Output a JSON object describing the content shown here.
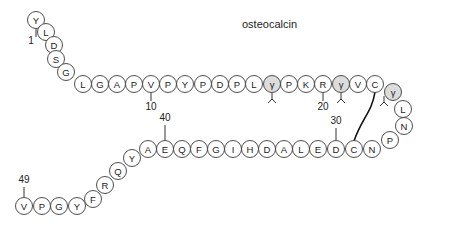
{
  "title": "osteocalcin",
  "sequence_note": "gamma = gamma-carboxyglutamate (Gla) residues, shaded",
  "residues": [
    {
      "n": 1,
      "aa": "Y",
      "x": 36,
      "y": 20
    },
    {
      "n": 2,
      "aa": "L",
      "x": 46,
      "y": 32
    },
    {
      "n": 3,
      "aa": "D",
      "x": 54,
      "y": 45
    },
    {
      "n": 4,
      "aa": "S",
      "x": 56,
      "y": 59
    },
    {
      "n": 5,
      "aa": "G",
      "x": 66,
      "y": 72
    },
    {
      "n": 6,
      "aa": "L",
      "x": 83,
      "y": 84
    },
    {
      "n": 7,
      "aa": "G",
      "x": 100,
      "y": 84
    },
    {
      "n": 8,
      "aa": "A",
      "x": 117,
      "y": 84
    },
    {
      "n": 9,
      "aa": "P",
      "x": 134,
      "y": 84
    },
    {
      "n": 10,
      "aa": "V",
      "x": 151,
      "y": 84
    },
    {
      "n": 11,
      "aa": "P",
      "x": 168,
      "y": 84
    },
    {
      "n": 12,
      "aa": "Y",
      "x": 185,
      "y": 84
    },
    {
      "n": 13,
      "aa": "P",
      "x": 203,
      "y": 84
    },
    {
      "n": 14,
      "aa": "D",
      "x": 220,
      "y": 84
    },
    {
      "n": 15,
      "aa": "P",
      "x": 237,
      "y": 84
    },
    {
      "n": 16,
      "aa": "L",
      "x": 254,
      "y": 84
    },
    {
      "n": 17,
      "aa": "γ",
      "x": 272,
      "y": 84,
      "gla": true
    },
    {
      "n": 18,
      "aa": "P",
      "x": 289,
      "y": 84
    },
    {
      "n": 19,
      "aa": "K",
      "x": 306,
      "y": 84
    },
    {
      "n": 20,
      "aa": "R",
      "x": 323,
      "y": 84
    },
    {
      "n": 21,
      "aa": "γ",
      "x": 341,
      "y": 84,
      "gla": true
    },
    {
      "n": 22,
      "aa": "V",
      "x": 358,
      "y": 84
    },
    {
      "n": 23,
      "aa": "C",
      "x": 375,
      "y": 84
    },
    {
      "n": 24,
      "aa": "γ",
      "x": 393,
      "y": 92,
      "gla": true
    },
    {
      "n": 25,
      "aa": "L",
      "x": 403,
      "y": 109
    },
    {
      "n": 26,
      "aa": "N",
      "x": 404,
      "y": 126
    },
    {
      "n": 27,
      "aa": "P",
      "x": 390,
      "y": 140
    },
    {
      "n": 28,
      "aa": "N",
      "x": 372,
      "y": 149
    },
    {
      "n": 29,
      "aa": "C",
      "x": 354,
      "y": 149
    },
    {
      "n": 30,
      "aa": "D",
      "x": 336,
      "y": 149
    },
    {
      "n": 31,
      "aa": "E",
      "x": 318,
      "y": 149
    },
    {
      "n": 32,
      "aa": "L",
      "x": 301,
      "y": 149
    },
    {
      "n": 33,
      "aa": "A",
      "x": 284,
      "y": 149
    },
    {
      "n": 34,
      "aa": "D",
      "x": 267,
      "y": 149
    },
    {
      "n": 35,
      "aa": "H",
      "x": 250,
      "y": 149
    },
    {
      "n": 36,
      "aa": "I",
      "x": 233,
      "y": 149
    },
    {
      "n": 37,
      "aa": "G",
      "x": 216,
      "y": 149
    },
    {
      "n": 38,
      "aa": "F",
      "x": 199,
      "y": 149
    },
    {
      "n": 39,
      "aa": "Q",
      "x": 182,
      "y": 149
    },
    {
      "n": 40,
      "aa": "E",
      "x": 165,
      "y": 149
    },
    {
      "n": 41,
      "aa": "A",
      "x": 148,
      "y": 149
    },
    {
      "n": 42,
      "aa": "Y",
      "x": 132,
      "y": 158
    },
    {
      "n": 43,
      "aa": "Q",
      "x": 118,
      "y": 171
    },
    {
      "n": 44,
      "aa": "R",
      "x": 105,
      "y": 185
    },
    {
      "n": 45,
      "aa": "F",
      "x": 93,
      "y": 199
    },
    {
      "n": 46,
      "aa": "Y",
      "x": 77,
      "y": 206
    },
    {
      "n": 47,
      "aa": "G",
      "x": 59,
      "y": 206
    },
    {
      "n": 48,
      "aa": "P",
      "x": 42,
      "y": 206
    },
    {
      "n": 49,
      "aa": "V",
      "x": 24,
      "y": 206
    }
  ],
  "numbers": [
    {
      "label": "1",
      "x": 31,
      "y": 44,
      "tick": [
        36,
        29,
        36,
        37
      ]
    },
    {
      "label": "10",
      "x": 151,
      "y": 110,
      "tick": [
        151,
        93,
        151,
        101
      ]
    },
    {
      "label": "20",
      "x": 323,
      "y": 110,
      "tick": [
        323,
        93,
        323,
        101
      ]
    },
    {
      "label": "30",
      "x": 336,
      "y": 124,
      "tick": [
        336,
        128,
        336,
        140
      ]
    },
    {
      "label": "40",
      "x": 165,
      "y": 121,
      "tick": [
        165,
        125,
        165,
        140
      ]
    },
    {
      "label": "49",
      "x": 24,
      "y": 183,
      "tick": [
        24,
        187,
        24,
        197
      ]
    }
  ],
  "disulfide": {
    "from": 23,
    "to": 29
  }
}
